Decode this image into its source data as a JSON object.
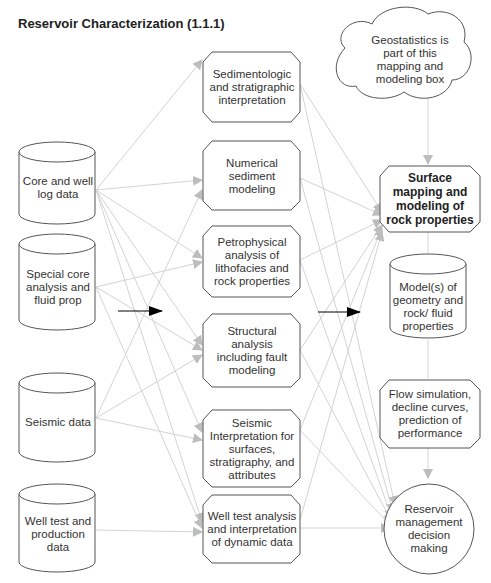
{
  "title": "Reservoir Characterization  (1.1.1)",
  "colors": {
    "connector": "#cfcfcf",
    "arrowhead": "#bdbdbd",
    "outline": "#555555",
    "highlight_arrow": "#000000"
  },
  "inputs": [
    {
      "id": "core",
      "label": "Core and well log data",
      "shape": "cylinder"
    },
    {
      "id": "scal",
      "label": "Special core analysis and fluid prop",
      "shape": "cylinder"
    },
    {
      "id": "seismic",
      "label": "Seismic data",
      "shape": "cylinder"
    },
    {
      "id": "welltest",
      "label": "Well test and production data",
      "shape": "cylinder"
    }
  ],
  "processes": [
    {
      "id": "sed",
      "label": "Sedimentologic and stratigraphic interpretation",
      "shape": "octagon"
    },
    {
      "id": "num",
      "label": "Numerical sediment modeling",
      "shape": "octagon"
    },
    {
      "id": "petro",
      "label": "Petrophysical analysis of lithofacies and rock properties",
      "shape": "octagon"
    },
    {
      "id": "struct",
      "label": "Structural analysis including fault modeling",
      "shape": "octagon"
    },
    {
      "id": "seisint",
      "label": "Seismic Interpretation for surfaces, stratigraphy, and attributes",
      "shape": "octagon"
    },
    {
      "id": "wtana",
      "label": "Well test analysis and interpretation of dynamic data",
      "shape": "octagon"
    }
  ],
  "outputs": {
    "cloud": {
      "label": "Geostatistics is part of this mapping and modeling box",
      "shape": "cloud"
    },
    "mapping": {
      "label": "Surface mapping and modeling of rock properties",
      "shape": "octagon",
      "bold": true
    },
    "models": {
      "label": "Model(s) of geometry and rock/ fluid properties",
      "shape": "cylinder"
    },
    "flow": {
      "label": "Flow simulation, decline curves, prediction of performance",
      "shape": "octagon"
    },
    "decision": {
      "label": "Reservoir management decision making",
      "shape": "circle"
    }
  }
}
